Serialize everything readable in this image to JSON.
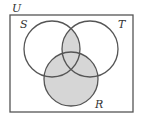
{
  "diagram": {
    "type": "venn",
    "universe_label": "U",
    "sets": [
      {
        "label": "S",
        "cx": 52,
        "cy": 49,
        "r": 28
      },
      {
        "label": "T",
        "cx": 90,
        "cy": 49,
        "r": 28
      },
      {
        "label": "R",
        "cx": 71,
        "cy": 79,
        "r": 27
      }
    ],
    "shaded_regions": [
      "S ∩ T",
      "R"
    ],
    "colors": {
      "stroke": "#555555",
      "shade": "#d6d6d6",
      "background": "#ffffff"
    }
  }
}
